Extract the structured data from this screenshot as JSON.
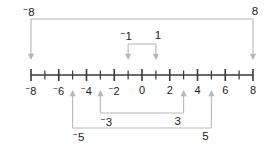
{
  "figure": {
    "axis": {
      "min": -8,
      "max": 8,
      "tick_step": 1,
      "labeled_step": 2,
      "labeled_ticks": [
        {
          "value": -8,
          "text": "8",
          "negative": true
        },
        {
          "value": -6,
          "text": "6",
          "negative": true
        },
        {
          "value": -4,
          "text": "4",
          "negative": true
        },
        {
          "value": -2,
          "text": "2",
          "negative": true
        },
        {
          "value": 0,
          "text": "0",
          "negative": false
        },
        {
          "value": 2,
          "text": "2",
          "negative": false
        },
        {
          "value": 4,
          "text": "4",
          "negative": false
        },
        {
          "value": 6,
          "text": "6",
          "negative": false
        },
        {
          "value": 8,
          "text": "8",
          "negative": false
        }
      ]
    },
    "brackets": [
      {
        "id": "pair-8",
        "side": "top",
        "arrow": "down",
        "from": -8,
        "to": 8,
        "left_label": {
          "text": "8",
          "negative": true
        },
        "right_label": {
          "text": "8",
          "negative": false
        }
      },
      {
        "id": "pair-1",
        "side": "top",
        "arrow": "down",
        "from": -1,
        "to": 1,
        "left_label": {
          "text": "1",
          "negative": true
        },
        "right_label": {
          "text": "1",
          "negative": false
        }
      },
      {
        "id": "pair-3",
        "side": "bottom",
        "arrow": "up",
        "from": -3,
        "to": 3,
        "left_label": {
          "text": "3",
          "negative": true
        },
        "right_label": {
          "text": "3",
          "negative": false
        }
      },
      {
        "id": "pair-5",
        "side": "bottom",
        "arrow": "up",
        "from": -5,
        "to": 5,
        "left_label": {
          "text": "5",
          "negative": true
        },
        "right_label": {
          "text": "5",
          "negative": false
        }
      }
    ],
    "colors": {
      "axis": "#3a3a3a",
      "bracket": "#b8b8b8",
      "text": "#1a1a1a",
      "background": "#ffffff"
    }
  },
  "chart_data": {
    "type": "line",
    "xlabel": "",
    "ylabel": "",
    "xlim": [
      -8,
      8
    ],
    "x": [
      -8,
      -7,
      -6,
      -5,
      -4,
      -3,
      -2,
      -1,
      0,
      1,
      2,
      3,
      4,
      5,
      6,
      7,
      8
    ],
    "tick_labels": [
      "⁻8",
      "",
      "⁻6",
      "",
      "⁻4",
      "",
      "⁻2",
      "",
      "0",
      "",
      "2",
      "",
      "4",
      "",
      "6",
      "",
      "8"
    ],
    "annotations": [
      {
        "label_left": "⁻8",
        "label_right": "8",
        "from": -8,
        "to": 8,
        "position": "above",
        "arrows": "down"
      },
      {
        "label_left": "⁻1",
        "label_right": "1",
        "from": -1,
        "to": 1,
        "position": "above",
        "arrows": "down"
      },
      {
        "label_left": "⁻3",
        "label_right": "3",
        "from": -3,
        "to": 3,
        "position": "below",
        "arrows": "up"
      },
      {
        "label_left": "⁻5",
        "label_right": "5",
        "from": -5,
        "to": 5,
        "position": "below",
        "arrows": "up"
      }
    ],
    "grid": false,
    "legend": "none"
  }
}
